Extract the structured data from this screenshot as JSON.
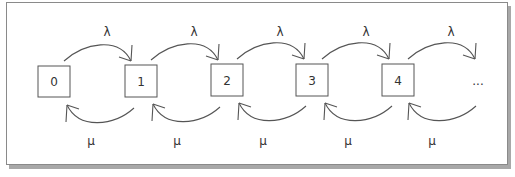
{
  "diagram": {
    "states": [
      "0",
      "1",
      "2",
      "3",
      "4",
      "..."
    ],
    "forward_rate_label": "λ",
    "backward_rate_label": "μ"
  }
}
